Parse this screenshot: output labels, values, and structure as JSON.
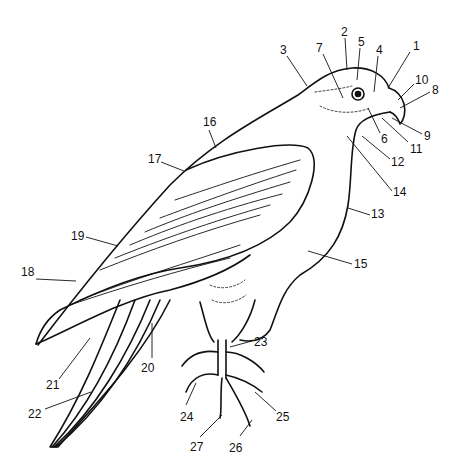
{
  "diagram": {
    "line_color": "#111111",
    "background": "#ffffff",
    "labels": [
      {
        "n": "1",
        "x": 413,
        "y": 40,
        "lx1": 410,
        "ly1": 52,
        "lx2": 388,
        "ly2": 88
      },
      {
        "n": "2",
        "x": 341,
        "y": 26,
        "lx1": 345,
        "ly1": 38,
        "lx2": 347,
        "ly2": 70
      },
      {
        "n": "3",
        "x": 280,
        "y": 44,
        "lx1": 287,
        "ly1": 56,
        "lx2": 307,
        "ly2": 86
      },
      {
        "n": "4",
        "x": 376,
        "y": 44,
        "lx1": 378,
        "ly1": 56,
        "lx2": 374,
        "ly2": 92
      },
      {
        "n": "5",
        "x": 358,
        "y": 36,
        "lx1": 360,
        "ly1": 48,
        "lx2": 357,
        "ly2": 80
      },
      {
        "n": "6",
        "x": 381,
        "y": 133,
        "lx1": 380,
        "ly1": 133,
        "lx2": 368,
        "ly2": 108
      },
      {
        "n": "7",
        "x": 316,
        "y": 42,
        "lx1": 323,
        "ly1": 54,
        "lx2": 343,
        "ly2": 98
      },
      {
        "n": "8",
        "x": 432,
        "y": 84,
        "lx1": 430,
        "ly1": 92,
        "lx2": 400,
        "ly2": 108
      },
      {
        "n": "9",
        "x": 424,
        "y": 130,
        "lx1": 422,
        "ly1": 134,
        "lx2": 392,
        "ly2": 118
      },
      {
        "n": "10",
        "x": 415,
        "y": 74,
        "lx1": 414,
        "ly1": 84,
        "lx2": 398,
        "ly2": 100
      },
      {
        "n": "11",
        "x": 410,
        "y": 143,
        "lx1": 408,
        "ly1": 142,
        "lx2": 382,
        "ly2": 118
      },
      {
        "n": "12",
        "x": 391,
        "y": 156,
        "lx1": 390,
        "ly1": 159,
        "lx2": 362,
        "ly2": 136
      },
      {
        "n": "13",
        "x": 371,
        "y": 208,
        "lx1": 370,
        "ly1": 215,
        "lx2": 348,
        "ly2": 208
      },
      {
        "n": "14",
        "x": 393,
        "y": 186,
        "lx1": 392,
        "ly1": 191,
        "lx2": 347,
        "ly2": 136
      },
      {
        "n": "15",
        "x": 354,
        "y": 258,
        "lx1": 352,
        "ly1": 264,
        "lx2": 308,
        "ly2": 251
      },
      {
        "n": "16",
        "x": 203,
        "y": 116,
        "lx1": 209,
        "ly1": 130,
        "lx2": 216,
        "ly2": 148
      },
      {
        "n": "17",
        "x": 148,
        "y": 153,
        "lx1": 161,
        "ly1": 162,
        "lx2": 184,
        "ly2": 171
      },
      {
        "n": "18",
        "x": 21,
        "y": 266,
        "lx1": 36,
        "ly1": 279,
        "lx2": 76,
        "ly2": 281
      },
      {
        "n": "19",
        "x": 71,
        "y": 230,
        "lx1": 86,
        "ly1": 237,
        "lx2": 118,
        "ly2": 246
      },
      {
        "n": "20",
        "x": 141,
        "y": 362,
        "lx1": 152,
        "ly1": 358,
        "lx2": 152,
        "ly2": 323
      },
      {
        "n": "21",
        "x": 46,
        "y": 379,
        "lx1": 59,
        "ly1": 379,
        "lx2": 90,
        "ly2": 338
      },
      {
        "n": "22",
        "x": 28,
        "y": 408,
        "lx1": 45,
        "ly1": 409,
        "lx2": 91,
        "ly2": 392
      },
      {
        "n": "23",
        "x": 254,
        "y": 336,
        "lx1": 252,
        "ly1": 341,
        "lx2": 230,
        "ly2": 347
      },
      {
        "n": "24",
        "x": 180,
        "y": 411,
        "lx1": 186,
        "ly1": 405,
        "lx2": 196,
        "ly2": 383
      },
      {
        "n": "25",
        "x": 276,
        "y": 411,
        "lx1": 276,
        "ly1": 411,
        "lx2": 255,
        "ly2": 392
      },
      {
        "n": "26",
        "x": 229,
        "y": 442,
        "lx1": 240,
        "ly1": 436,
        "lx2": 252,
        "ly2": 420
      },
      {
        "n": "27",
        "x": 190,
        "y": 441,
        "lx1": 200,
        "ly1": 437,
        "lx2": 222,
        "ly2": 415
      }
    ]
  }
}
